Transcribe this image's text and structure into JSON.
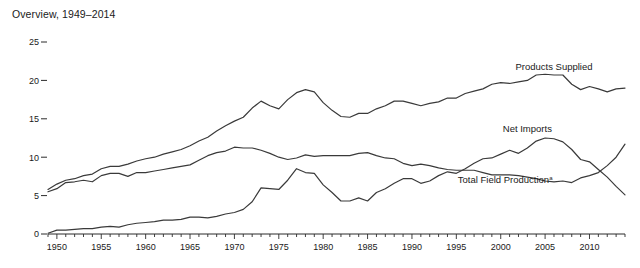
{
  "chart_data": {
    "type": "line",
    "title": "Overview, 1949–2014",
    "xlabel": "",
    "ylabel": "",
    "xlim": [
      1949,
      2014
    ],
    "ylim": [
      0,
      25
    ],
    "grid": false,
    "legend_position": "inline-annotations",
    "y_ticks": [
      0,
      5,
      10,
      15,
      20,
      25
    ],
    "x_ticks": [
      1950,
      1955,
      1960,
      1965,
      1970,
      1975,
      1980,
      1985,
      1990,
      1995,
      2000,
      2005,
      2010
    ],
    "x_minor_tick_interval": 1,
    "footnote_marker": "a",
    "x": [
      1949,
      1950,
      1951,
      1952,
      1953,
      1954,
      1955,
      1956,
      1957,
      1958,
      1959,
      1960,
      1961,
      1962,
      1963,
      1964,
      1965,
      1966,
      1967,
      1968,
      1969,
      1970,
      1971,
      1972,
      1973,
      1974,
      1975,
      1976,
      1977,
      1978,
      1979,
      1980,
      1981,
      1982,
      1983,
      1984,
      1985,
      1986,
      1987,
      1988,
      1989,
      1990,
      1991,
      1992,
      1993,
      1994,
      1995,
      1996,
      1997,
      1998,
      1999,
      2000,
      2001,
      2002,
      2003,
      2004,
      2005,
      2006,
      2007,
      2008,
      2009,
      2010,
      2011,
      2012,
      2013,
      2014
    ],
    "series": [
      {
        "name": "Products Supplied",
        "label": "Products Supplied",
        "color": "#3a3a3a",
        "label_x": 2006.0,
        "label_y": 21.4,
        "values": [
          5.8,
          6.5,
          7.0,
          7.2,
          7.6,
          7.8,
          8.5,
          8.8,
          8.8,
          9.1,
          9.5,
          9.8,
          10.0,
          10.4,
          10.7,
          11.0,
          11.5,
          12.1,
          12.6,
          13.4,
          14.1,
          14.7,
          15.2,
          16.4,
          17.3,
          16.7,
          16.3,
          17.5,
          18.4,
          18.8,
          18.5,
          17.1,
          16.1,
          15.3,
          15.2,
          15.7,
          15.7,
          16.3,
          16.7,
          17.3,
          17.3,
          17.0,
          16.7,
          17.0,
          17.2,
          17.7,
          17.7,
          18.3,
          18.6,
          18.9,
          19.5,
          19.7,
          19.6,
          19.8,
          20.0,
          20.7,
          20.8,
          20.7,
          20.7,
          19.5,
          18.8,
          19.2,
          18.9,
          18.5,
          18.9,
          19.0
        ]
      },
      {
        "name": "Net Imports",
        "label": "Net Imports",
        "color": "#3a3a3a",
        "label_x": 2003.0,
        "label_y": 13.3,
        "values": [
          0.1,
          0.5,
          0.5,
          0.6,
          0.7,
          0.7,
          0.9,
          1.0,
          0.9,
          1.2,
          1.4,
          1.5,
          1.6,
          1.8,
          1.8,
          1.9,
          2.2,
          2.2,
          2.1,
          2.3,
          2.6,
          2.8,
          3.2,
          4.2,
          6.0,
          5.9,
          5.8,
          7.0,
          8.5,
          8.0,
          7.9,
          6.4,
          5.4,
          4.3,
          4.3,
          4.7,
          4.3,
          5.4,
          5.9,
          6.6,
          7.2,
          7.2,
          6.6,
          6.9,
          7.6,
          8.1,
          7.9,
          8.5,
          9.2,
          9.8,
          9.9,
          10.4,
          10.9,
          10.5,
          11.2,
          12.1,
          12.5,
          12.4,
          12.0,
          11.0,
          9.7,
          9.4,
          8.4,
          7.4,
          6.2,
          5.1
        ]
      },
      {
        "name": "Total Field Production",
        "label": "Total Field Production",
        "color": "#3a3a3a",
        "label_x": 2000.5,
        "label_y": 6.6,
        "values": [
          5.5,
          5.9,
          6.7,
          6.8,
          7.0,
          6.8,
          7.6,
          7.9,
          7.9,
          7.5,
          8.0,
          8.0,
          8.2,
          8.4,
          8.6,
          8.8,
          9.0,
          9.6,
          10.2,
          10.6,
          10.8,
          11.3,
          11.2,
          11.2,
          10.9,
          10.5,
          10.0,
          9.7,
          9.9,
          10.3,
          10.1,
          10.2,
          10.2,
          10.2,
          10.2,
          10.5,
          10.6,
          10.2,
          9.9,
          9.8,
          9.2,
          8.9,
          9.1,
          8.9,
          8.6,
          8.4,
          8.3,
          8.3,
          8.3,
          8.0,
          7.7,
          7.7,
          7.7,
          7.6,
          7.4,
          7.2,
          6.9,
          6.8,
          6.9,
          6.7,
          7.3,
          7.6,
          8.0,
          8.9,
          10.0,
          11.7
        ]
      }
    ]
  }
}
